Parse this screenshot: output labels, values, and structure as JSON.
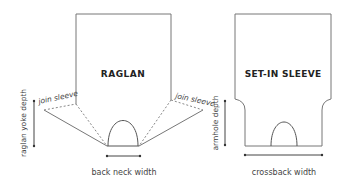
{
  "raglan": {
    "title": "RAGLAN",
    "join_sleeve_left": "join sleeve",
    "join_sleeve_right": "join sleeve",
    "yoke_depth_label": "raglan yoke depth",
    "back_neck_label": "back neck width"
  },
  "setin": {
    "title": "SET-IN SLEEVE",
    "armhole_label": "armhole depth",
    "crossback_label": "crossback width"
  },
  "colors": {
    "outline": "#777777",
    "text": "#444444",
    "title": "#222222",
    "background": "#ffffff"
  }
}
